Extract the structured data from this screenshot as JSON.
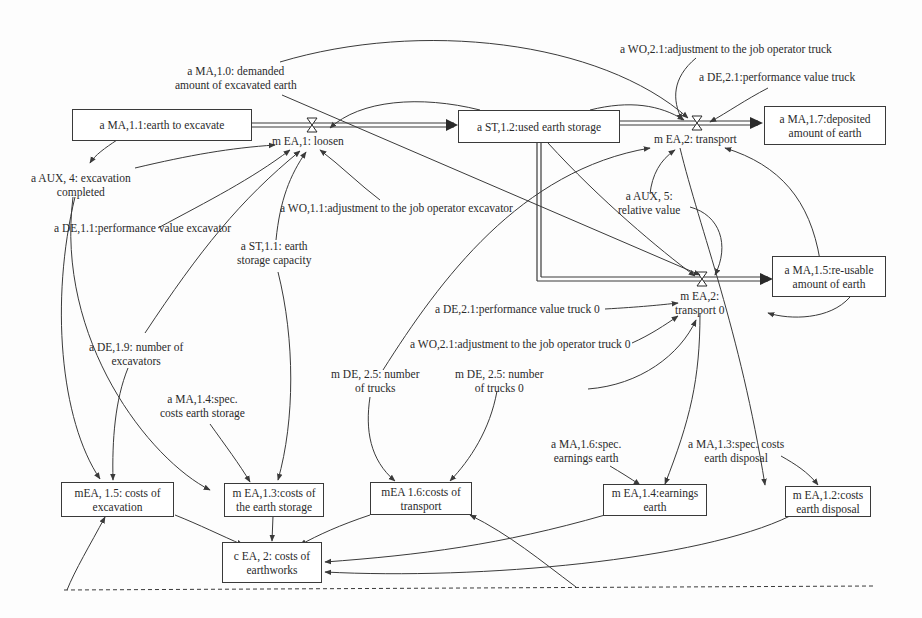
{
  "diagram": {
    "type": "system dynamics stock-and-flow diagram",
    "stocks": {
      "earth_to_excavate": [
        "a MA,1.1:earth to excavate"
      ],
      "used_earth_storage": [
        "a ST,1.2:used earth storage"
      ],
      "deposited_amount": [
        "a MA,1.7:deposited",
        "amount of earth"
      ],
      "reusable_amount": [
        "a MA,1.5:re-usable",
        "amount of earth"
      ]
    },
    "flows": {
      "loosen": [
        "m EA,1: loosen"
      ],
      "transport": [
        "m EA,2: transport"
      ],
      "transport0": [
        "m EA,2:",
        "transport 0"
      ]
    },
    "auxiliaries": {
      "demanded_amount": [
        "a MA,1.0: demanded",
        "amount of excavated earth"
      ],
      "excavation_completed": [
        "a AUX, 4: excavation",
        "completed"
      ],
      "perf_excavator": [
        "a DE,1.1:performance value excavator"
      ],
      "earth_storage_capacity": [
        "a ST,1.1: earth",
        "storage capacity"
      ],
      "wo_excavator": [
        "a WO,1.1:adjustment to the job operator excavator"
      ],
      "number_excavators": [
        "a DE,1.9: number of",
        "excavators"
      ],
      "spec_costs_storage": [
        "a MA,1.4:spec.",
        "costs earth storage"
      ],
      "wo_truck": [
        "a WO,2.1:adjustment to the job operator truck"
      ],
      "perf_truck": [
        "a DE,2.1:performance value truck"
      ],
      "relative_value": [
        "a AUX, 5:",
        "relative value"
      ],
      "perf_truck0": [
        "a DE,2.1:performance value truck 0"
      ],
      "wo_truck0": [
        "a WO,2.1:adjustment to the job operator truck 0"
      ],
      "number_trucks": [
        "m DE, 2.5: number",
        "of trucks"
      ],
      "number_trucks0": [
        "m DE, 2.5: number",
        "of trucks 0"
      ],
      "spec_earnings": [
        "a MA,1.6:spec.",
        "earnings earth"
      ],
      "spec_costs_disposal": [
        "a MA,1.3:spec. costs",
        "earth disposal"
      ]
    },
    "cost_nodes": {
      "costs_excavation": [
        "mEA, 1.5: costs of",
        "excavation"
      ],
      "costs_storage": [
        "m EA,1.3:costs of",
        "the earth storage"
      ],
      "costs_transport": [
        "mEA 1.6:costs of",
        "transport"
      ],
      "earnings_earth": [
        "m EA,1.4:earnings",
        "earth"
      ],
      "costs_disposal": [
        "m EA,1.2:costs",
        "earth disposal"
      ],
      "costs_earthworks": [
        "c EA, 2: costs of",
        "earthworks"
      ]
    },
    "colors": {
      "line": "#3a3a3a",
      "text": "#2a2a2a",
      "background": "#fdfdfd"
    }
  }
}
